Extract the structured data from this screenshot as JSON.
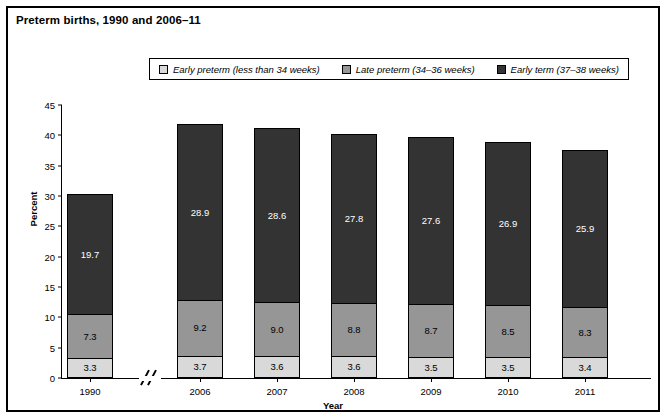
{
  "figure": {
    "title": "Preterm births, 1990 and 2006–11"
  },
  "legend": {
    "items": [
      {
        "label": "Early preterm (less than 34 weeks)",
        "color": "#d9d9d9",
        "key": "early_preterm"
      },
      {
        "label": "Late preterm (34–36 weeks)",
        "color": "#969696",
        "key": "late_preterm"
      },
      {
        "label": "Early term (37–38 weeks)",
        "color": "#333333",
        "key": "early_term"
      }
    ]
  },
  "axes": {
    "y_title": "Percent",
    "x_title": "Year",
    "y_ticks": [
      "0",
      "5",
      "10",
      "15",
      "20",
      "25",
      "30",
      "35",
      "40",
      "45"
    ],
    "x_break_after_index": 0
  },
  "chart_data": {
    "type": "bar",
    "stacked": true,
    "title": "Preterm births, 1990 and 2006–11",
    "xlabel": "Year",
    "ylabel": "Percent",
    "ylim": [
      0,
      45
    ],
    "ytick_step": 5,
    "grid": false,
    "legend_position": "top-center",
    "axis_break": "x-axis break between 1990 and 2006",
    "categories": [
      "1990",
      "2006",
      "2007",
      "2008",
      "2009",
      "2010",
      "2011"
    ],
    "series": [
      {
        "name": "Early preterm (less than 34 weeks)",
        "color": "#d9d9d9",
        "values": [
          3.3,
          3.7,
          3.6,
          3.6,
          3.5,
          3.5,
          3.4
        ]
      },
      {
        "name": "Late preterm (34–36 weeks)",
        "color": "#969696",
        "values": [
          7.3,
          9.2,
          9.0,
          8.8,
          8.7,
          8.5,
          8.3
        ]
      },
      {
        "name": "Early term (37–38 weeks)",
        "color": "#333333",
        "values": [
          19.7,
          28.9,
          28.6,
          27.8,
          27.6,
          26.9,
          25.9
        ]
      }
    ],
    "totals": [
      30.3,
      41.8,
      41.2,
      40.2,
      39.8,
      38.9,
      37.6
    ]
  }
}
